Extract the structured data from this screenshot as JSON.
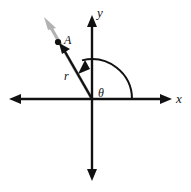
{
  "figure": {
    "background_color": "#ffffff"
  },
  "axes": {
    "x_label": "x",
    "y_label": "y",
    "axis_color": "#111111",
    "origin": {
      "x": 92,
      "y": 99
    },
    "x_axis": {
      "left_end": 9,
      "right_end": 172,
      "y": 99
    },
    "y_axis": {
      "top_end": 15,
      "bottom_end": 181,
      "x": 92
    }
  },
  "ray": {
    "name": "terminal-side-ray",
    "color": "#b0b0b0",
    "from": {
      "x": 92,
      "y": 99
    },
    "to": {
      "x": 45,
      "y": 18
    },
    "angle_degrees": 120
  },
  "vector": {
    "name": "r",
    "label": "r",
    "color": "#111111",
    "from": {
      "x": 92,
      "y": 99
    },
    "to": {
      "x": 60,
      "y": 44
    }
  },
  "point": {
    "label": "A",
    "color": "#111111",
    "x": 58,
    "y": 42
  },
  "angle": {
    "label": "θ",
    "color": "#111111",
    "radius": 40,
    "start_degrees": 0,
    "end_degrees": 120,
    "label_x": 99,
    "label_y": 93
  }
}
